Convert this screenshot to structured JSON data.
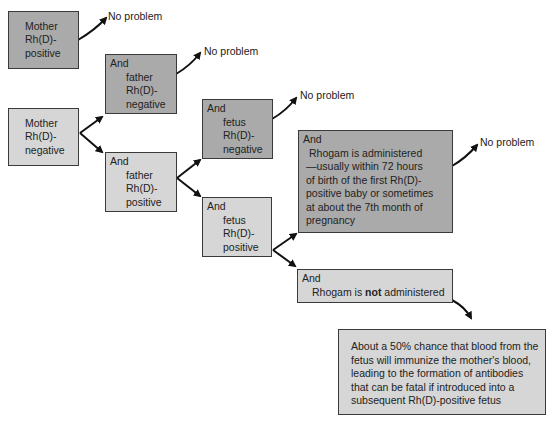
{
  "colors": {
    "dark_box": "#aaaaaa",
    "light_box": "#d6d6d6",
    "border": "#3a3a3a",
    "arrow": "#111111"
  },
  "nodes": {
    "mother_positive": {
      "lines": [
        "Mother",
        "Rh(D)-",
        "positive"
      ]
    },
    "mother_negative": {
      "lines": [
        "Mother",
        "Rh(D)-",
        "negative"
      ]
    },
    "father_negative": {
      "lead": "And",
      "lines": [
        "father",
        "Rh(D)-",
        "negative"
      ]
    },
    "father_positive": {
      "lead": "And",
      "lines": [
        "father",
        "Rh(D)-",
        "positive"
      ]
    },
    "fetus_negative": {
      "lead": "And",
      "lines": [
        "fetus",
        "Rh(D)-",
        "negative"
      ]
    },
    "fetus_positive": {
      "lead": "And",
      "lines": [
        "fetus",
        "Rh(D)-",
        "positive"
      ]
    },
    "rhogam_administered": {
      "lead": "And",
      "lines": [
        "Rhogam is administered",
        "—usually within 72 hours",
        "of birth of the first Rh(D)-",
        "positive baby or sometimes",
        "at about the 7th month of",
        "pregnancy"
      ]
    },
    "rhogam_not": {
      "lead": "And",
      "pre": "Rhogam is ",
      "bold": "not",
      "post": " administered"
    },
    "outcome": {
      "lines": [
        "About a 50% chance that blood from the",
        "fetus will immunize the mother's blood,",
        "leading to the formation of antibodies",
        "that can be fatal if introduced into a",
        "subsequent Rh(D)-positive fetus"
      ]
    }
  },
  "outcomes": {
    "no_problem_1": "No problem",
    "no_problem_2": "No problem",
    "no_problem_3": "No problem",
    "no_problem_4": "No problem"
  }
}
